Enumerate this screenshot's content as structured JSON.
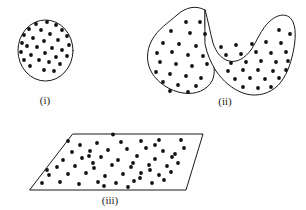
{
  "figure": {
    "background_color": "#fefefe",
    "outline_color": "#1a1a1a",
    "dot_color": "#111111",
    "width": 306,
    "height": 210,
    "panels": [
      {
        "id": "panel-i",
        "label": "(i)",
        "shape": "circle",
        "shape_name": "circle-region",
        "label_x": 45,
        "label_y": 104,
        "dot_count": 30,
        "geometry": {
          "cx": 45.5,
          "cy": 50.5,
          "rx": 27.5,
          "ry": 30.5
        },
        "dot_radius": 1.9,
        "dots": [
          [
            47,
            22
          ],
          [
            36,
            24
          ],
          [
            56,
            25
          ],
          [
            29,
            29
          ],
          [
            41,
            30
          ],
          [
            62,
            30
          ],
          [
            24,
            35
          ],
          [
            50,
            34
          ],
          [
            67,
            36
          ],
          [
            33,
            38
          ],
          [
            58,
            40
          ],
          [
            44,
            41
          ],
          [
            22,
            43
          ],
          [
            27,
            46
          ],
          [
            69,
            45
          ],
          [
            37,
            47
          ],
          [
            52,
            48
          ],
          [
            62,
            50
          ],
          [
            21,
            52
          ],
          [
            45,
            53
          ],
          [
            31,
            55
          ],
          [
            56,
            57
          ],
          [
            67,
            56
          ],
          [
            24,
            60
          ],
          [
            39,
            60
          ],
          [
            49,
            62
          ],
          [
            60,
            64
          ],
          [
            30,
            66
          ],
          [
            44,
            70
          ],
          [
            54,
            71
          ]
        ]
      },
      {
        "id": "panel-ii",
        "label": "(ii)",
        "shape": "double-blob",
        "shape_name": "double-blob-region",
        "label_x": 225,
        "label_y": 105,
        "dot_count": 54,
        "geometry": {
          "left_lobe_path": "M 205,10 C 196,5 186,7 177,15 C 168,23 158,29 152,40 C 146,51 146,63 152,73 C 158,83 170,91 183,93 C 196,95 207,90 212,81 C 216,73 214,63 211,54 C 208,45 206,35 205,26 Z",
          "right_lobe_path": "M 205,10 C 208,20 210,32 213,43 C 216,52 221,59 229,61 C 237,63 245,58 251,50 C 257,41 261,29 270,21 C 279,13 289,13 293,22 C 297,31 295,45 292,57 C 289,69 284,81 275,88 C 266,95 254,97 243,93 C 232,89 223,81 216,71 C 211,63 207,54 205,44 Z"
        },
        "dot_radius": 1.9,
        "dots_left": [
          [
            186,
            22
          ],
          [
            200,
            22
          ],
          [
            171,
            31
          ],
          [
            190,
            33
          ],
          [
            205,
            34
          ],
          [
            163,
            43
          ],
          [
            179,
            44
          ],
          [
            196,
            46
          ],
          [
            157,
            53
          ],
          [
            172,
            52
          ],
          [
            188,
            55
          ],
          [
            203,
            56
          ],
          [
            160,
            62
          ],
          [
            176,
            64
          ],
          [
            192,
            66
          ],
          [
            207,
            64
          ],
          [
            156,
            72
          ],
          [
            170,
            74
          ],
          [
            186,
            76
          ],
          [
            201,
            78
          ],
          [
            163,
            82
          ],
          [
            178,
            85
          ],
          [
            196,
            86
          ],
          [
            170,
            91
          ],
          [
            188,
            92
          ]
        ],
        "dots_right": [
          [
            221,
            47
          ],
          [
            236,
            45
          ],
          [
            252,
            44
          ],
          [
            266,
            42
          ],
          [
            281,
            43
          ],
          [
            226,
            55
          ],
          [
            241,
            54
          ],
          [
            256,
            52
          ],
          [
            271,
            53
          ],
          [
            286,
            52
          ],
          [
            231,
            63
          ],
          [
            246,
            62
          ],
          [
            261,
            61
          ],
          [
            276,
            62
          ],
          [
            288,
            61
          ],
          [
            228,
            71
          ],
          [
            243,
            70
          ],
          [
            258,
            70
          ],
          [
            273,
            71
          ],
          [
            286,
            70
          ],
          [
            235,
            79
          ],
          [
            250,
            78
          ],
          [
            265,
            79
          ],
          [
            279,
            78
          ],
          [
            243,
            87
          ],
          [
            258,
            88
          ],
          [
            271,
            87
          ],
          [
            279,
            30
          ],
          [
            290,
            34
          ]
        ]
      },
      {
        "id": "panel-iii",
        "label": "(iii)",
        "shape": "parallelogram",
        "shape_name": "plane-region",
        "label_x": 110,
        "label_y": 204,
        "dot_count": 56,
        "geometry": {
          "points": "73,134 203,134 186,190 30,190"
        },
        "dot_radius": 1.9,
        "dots": [
          [
            80,
            145
          ],
          [
            97,
            143
          ],
          [
            121,
            142
          ],
          [
            141,
            141
          ],
          [
            159,
            140
          ],
          [
            181,
            140
          ],
          [
            72,
            152
          ],
          [
            90,
            151
          ],
          [
            108,
            150
          ],
          [
            127,
            149
          ],
          [
            146,
            148
          ],
          [
            163,
            151
          ],
          [
            184,
            148
          ],
          [
            63,
            160
          ],
          [
            82,
            158
          ],
          [
            101,
            157
          ],
          [
            118,
            160
          ],
          [
            137,
            156
          ],
          [
            155,
            159
          ],
          [
            172,
            157
          ],
          [
            57,
            167
          ],
          [
            75,
            166
          ],
          [
            94,
            168
          ],
          [
            112,
            165
          ],
          [
            131,
            167
          ],
          [
            149,
            165
          ],
          [
            167,
            166
          ],
          [
            178,
            163
          ],
          [
            49,
            175
          ],
          [
            68,
            174
          ],
          [
            86,
            173
          ],
          [
            105,
            176
          ],
          [
            123,
            174
          ],
          [
            141,
            173
          ],
          [
            159,
            175
          ],
          [
            171,
            172
          ],
          [
            42,
            183
          ],
          [
            60,
            182
          ],
          [
            79,
            184
          ],
          [
            98,
            182
          ],
          [
            116,
            183
          ],
          [
            134,
            181
          ],
          [
            152,
            183
          ],
          [
            164,
            180
          ],
          [
            113,
            134.5
          ],
          [
            89,
            156
          ],
          [
            133,
            163
          ],
          [
            150,
            170
          ],
          [
            104,
            186
          ],
          [
            128,
            187
          ],
          [
            68,
            141
          ],
          [
            155,
            145
          ],
          [
            175,
            154
          ],
          [
            47,
            170
          ],
          [
            93,
            163
          ],
          [
            140,
            178
          ]
        ]
      }
    ]
  }
}
